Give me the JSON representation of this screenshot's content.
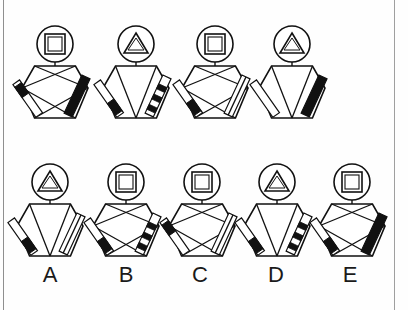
{
  "puzzle": {
    "type": "visual-analogy-figure-matrix",
    "stroke_color": "#111111",
    "fill_black": "#111111",
    "fill_white": "#ffffff",
    "background_color": "#fefefe",
    "border_color": "#9a9a9a",
    "prompt_row": {
      "name": "top-row-stimuli",
      "count": 4,
      "figures": [
        {
          "id": "top-1",
          "head_shape": "square",
          "head_outline": "circle",
          "body_shape": "hexagon",
          "body_pattern": "x-cross",
          "left_leg": "outline-with-black-foot",
          "right_leg": "solid-black",
          "cx": 55
        },
        {
          "id": "top-2",
          "head_shape": "triangle",
          "head_outline": "circle",
          "body_shape": "hexagon",
          "body_pattern": "v-cross",
          "left_leg": "outline-with-black-band",
          "right_leg": "striped-checkered",
          "cx": 136
        },
        {
          "id": "top-3",
          "head_shape": "square",
          "head_outline": "circle",
          "body_shape": "hexagon",
          "body_pattern": "x-cross",
          "left_leg": "outline-with-black-band",
          "right_leg": "double-line",
          "cx": 215
        },
        {
          "id": "top-4",
          "head_shape": "triangle",
          "head_outline": "circle",
          "body_shape": "hexagon",
          "body_pattern": "v-cross",
          "left_leg": "outline-plain",
          "right_leg": "solid-black",
          "cx": 292
        }
      ]
    },
    "answer_row": {
      "name": "bottom-row-answer-options",
      "count": 5,
      "figures": [
        {
          "id": "option-A",
          "label": "A",
          "head_shape": "triangle",
          "head_outline": "circle",
          "body_shape": "hexagon",
          "body_pattern": "v-cross",
          "left_leg": "outline-with-black-band",
          "right_leg": "double-line",
          "cx": 50,
          "label_x": 50
        },
        {
          "id": "option-B",
          "label": "B",
          "head_shape": "square",
          "head_outline": "circle",
          "body_shape": "hexagon",
          "body_pattern": "x-cross",
          "left_leg": "outline-with-black-band",
          "right_leg": "striped-checkered",
          "cx": 126,
          "label_x": 126
        },
        {
          "id": "option-C",
          "label": "C",
          "head_shape": "square",
          "head_outline": "circle",
          "body_shape": "hexagon",
          "body_pattern": "x-cross",
          "left_leg": "outline-with-black-foot",
          "right_leg": "double-line",
          "cx": 202,
          "label_x": 200
        },
        {
          "id": "option-D",
          "label": "D",
          "head_shape": "triangle",
          "head_outline": "circle",
          "body_shape": "hexagon",
          "body_pattern": "v-cross",
          "left_leg": "outline-with-black-band",
          "right_leg": "striped-checkered",
          "cx": 277,
          "label_x": 276
        },
        {
          "id": "option-E",
          "label": "E",
          "head_shape": "square",
          "head_outline": "circle",
          "body_shape": "hexagon",
          "body_pattern": "x-cross",
          "left_leg": "outline-with-black-band",
          "right_leg": "solid-black",
          "cx": 352,
          "label_x": 350
        }
      ]
    },
    "labels": [
      "A",
      "B",
      "C",
      "D",
      "E"
    ]
  }
}
